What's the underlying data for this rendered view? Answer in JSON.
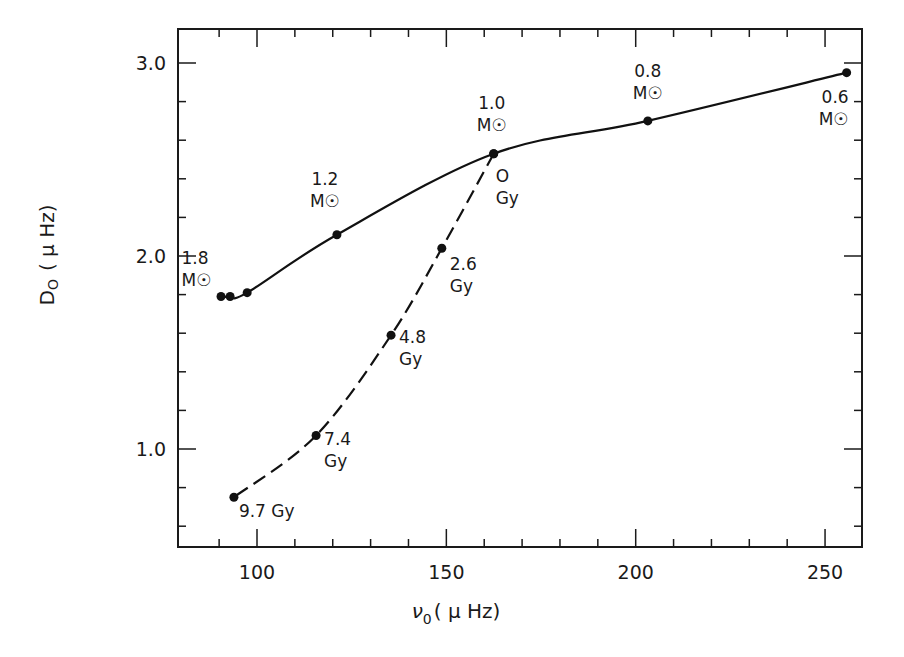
{
  "chart_data": {
    "type": "line",
    "title": "",
    "xlabel": "ν0 (μHz)",
    "ylabel": "D0 (μHz)",
    "xlim": [
      79,
      260
    ],
    "ylim": [
      0.5,
      3.17
    ],
    "x_ticks_major": [
      100,
      150,
      200,
      250
    ],
    "x_tick_labels": [
      "100",
      "150",
      "200",
      "250"
    ],
    "x_minor_step": 10,
    "y_ticks_major": [
      1.0,
      2.0,
      3.0
    ],
    "y_tick_labels": [
      "1.0",
      "2.0",
      "3.0"
    ],
    "y_minor_step": 0.2,
    "grid": false,
    "legend": null,
    "series": [
      {
        "name": "mass sequence (solid)",
        "style": "solid",
        "points": [
          {
            "x": 90.5,
            "y": 1.79,
            "label": ""
          },
          {
            "x": 92.9,
            "y": 1.79,
            "label": ""
          },
          {
            "x": 97.4,
            "y": 1.81,
            "label": "1.8 M☉"
          },
          {
            "x": 121.1,
            "y": 2.11,
            "label": "1.2 M☉"
          },
          {
            "x": 162.5,
            "y": 2.53,
            "label": "1.0 M☉"
          },
          {
            "x": 203.2,
            "y": 2.7,
            "label": "0.8 M☉"
          },
          {
            "x": 255.7,
            "y": 2.95,
            "label": "0.6 M☉"
          }
        ]
      },
      {
        "name": "age sequence (dashed)",
        "style": "dashed",
        "points": [
          {
            "x": 162.5,
            "y": 2.53,
            "label": "0 Gy"
          },
          {
            "x": 148.8,
            "y": 2.04,
            "label": "2.6 Gy"
          },
          {
            "x": 135.4,
            "y": 1.59,
            "label": "4.8 Gy"
          },
          {
            "x": 115.6,
            "y": 1.07,
            "label": "7.4 Gy"
          },
          {
            "x": 93.9,
            "y": 0.75,
            "label": "9.7 Gy"
          }
        ]
      }
    ],
    "annotations": [
      {
        "text": [
          "1.8",
          "M☉"
        ],
        "x": 88,
        "y": 1.96,
        "anchor": "start",
        "dx": -30,
        "dy": 0
      },
      {
        "text": [
          "1.2",
          "M☉"
        ],
        "x": 121.1,
        "y": 2.11,
        "anchor": "middle",
        "dx": -12,
        "dy": -50
      },
      {
        "text": [
          "1.0",
          "M☉"
        ],
        "x": 162.5,
        "y": 2.53,
        "anchor": "middle",
        "dx": -2,
        "dy": -45
      },
      {
        "text": [
          "O",
          "Gy"
        ],
        "x": 162.5,
        "y": 2.53,
        "anchor": "start",
        "dx": 2,
        "dy": 28
      },
      {
        "text": [
          "0.8",
          "M☉"
        ],
        "x": 203.2,
        "y": 2.7,
        "anchor": "middle",
        "dx": 0,
        "dy": -44
      },
      {
        "text": [
          "0.6",
          "M☉"
        ],
        "x": 255.7,
        "y": 2.95,
        "anchor": "end",
        "dx": 2,
        "dy": 30
      },
      {
        "text": [
          "2.6",
          "Gy"
        ],
        "x": 148.8,
        "y": 2.04,
        "anchor": "start",
        "dx": 8,
        "dy": 22
      },
      {
        "text": [
          "4.8",
          "Gy"
        ],
        "x": 135.4,
        "y": 1.59,
        "anchor": "start",
        "dx": 8,
        "dy": 8
      },
      {
        "text": [
          "7.4",
          "Gy"
        ],
        "x": 115.6,
        "y": 1.07,
        "anchor": "start",
        "dx": 8,
        "dy": 10
      },
      {
        "text": [
          "9.7 Gy"
        ],
        "x": 93.9,
        "y": 0.75,
        "anchor": "start",
        "dx": 5,
        "dy": 20
      }
    ]
  },
  "axes": {
    "x_title_main": "ν",
    "x_title_sub": "0",
    "x_title_unit": "( μ Hz)",
    "y_title_main": "D",
    "y_title_sub": "O",
    "y_title_unit": "( μ Hz)"
  }
}
